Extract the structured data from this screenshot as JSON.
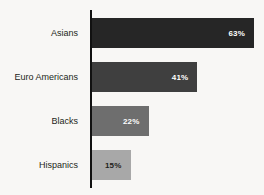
{
  "chart_data": {
    "type": "bar",
    "orientation": "horizontal",
    "title": "",
    "subtitle": "",
    "xlabel": "",
    "ylabel": "",
    "categories": [
      "Asians",
      "Euro Americans",
      "Blacks",
      "Hispanics"
    ],
    "values": [
      63,
      41,
      22,
      15
    ],
    "value_labels": [
      "63%",
      "41%",
      "22%",
      "15%"
    ],
    "xlim": [
      0,
      63
    ],
    "grid": false,
    "legend": null,
    "annotations": [],
    "bar_colors": [
      "#262626",
      "#3f3f3f",
      "#6e6e6e",
      "#a8a8a8"
    ],
    "label_colors": [
      "#ffffff",
      "#ffffff",
      "#ffffff",
      "#231f20"
    ],
    "axis_color": "#111111",
    "background_color": "#f8f7f5"
  }
}
